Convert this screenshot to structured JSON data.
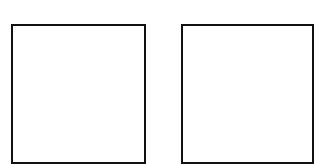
{
  "boxes": [
    {
      "id": "left",
      "label": ""
    },
    {
      "id": "right",
      "label": ""
    }
  ],
  "colors": {
    "border": "#111111",
    "background": "#ffffff"
  }
}
